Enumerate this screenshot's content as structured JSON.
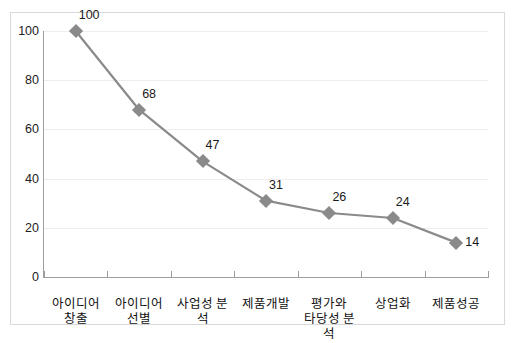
{
  "chart_data": {
    "type": "line",
    "title": "",
    "xlabel": "",
    "ylabel": "",
    "categories": [
      "아이디어 창출",
      "아이디어 선별",
      "사업성 분석",
      "제품개발",
      "평가와 타당성 분석",
      "상업화",
      "제품성공"
    ],
    "category_lines": [
      [
        "아이디어",
        "창출"
      ],
      [
        "아이디어",
        "선별"
      ],
      [
        "사업성 분석",
        ""
      ],
      [
        "제품개발",
        ""
      ],
      [
        "평가와",
        "타당성 분석"
      ],
      [
        "상업화",
        ""
      ],
      [
        "제품성공",
        ""
      ]
    ],
    "values": [
      100,
      68,
      47,
      31,
      26,
      24,
      14
    ],
    "data_labels": [
      "100",
      "68",
      "47",
      "31",
      "26",
      "24",
      "14"
    ],
    "ylim": [
      0,
      100
    ],
    "yticks": [
      0,
      20,
      40,
      60,
      80,
      100
    ],
    "ytick_labels": [
      "0",
      "20",
      "40",
      "60",
      "80",
      "100"
    ],
    "grid": true,
    "legend": false,
    "marker": "diamond",
    "colors": {
      "line": "#8a8a8a",
      "marker": "#8a8a8a",
      "grid": "#ededed",
      "axis": "#9e9e9e",
      "frame": "#d9d9d9",
      "text": "#1a1a1a"
    }
  }
}
